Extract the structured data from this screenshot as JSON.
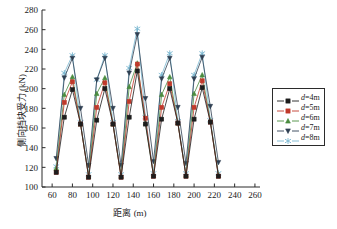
{
  "axes": {
    "xlabel": "距离 (m)",
    "ylabel": "侧向挡块受力 (kN)",
    "xticks": [
      60,
      80,
      100,
      120,
      140,
      160,
      180,
      200,
      220,
      240,
      260
    ],
    "yticks": [
      100,
      120,
      140,
      160,
      180,
      200,
      220,
      240,
      260,
      280
    ],
    "xlim": [
      50,
      265
    ],
    "ylim": [
      100,
      280
    ]
  },
  "legend": {
    "items": [
      {
        "label": "d=4m",
        "sym": "d",
        "rest": "=4m",
        "color": "#1d1d1d",
        "marker": "square"
      },
      {
        "label": "d=5m",
        "sym": "d",
        "rest": "=5m",
        "color": "#c0392b",
        "marker": "square"
      },
      {
        "label": "d=6m",
        "sym": "d",
        "rest": "=6m",
        "color": "#4a8c3f",
        "marker": "triangle-up"
      },
      {
        "label": "d=7m",
        "sym": "d",
        "rest": "=7m",
        "color": "#2f3f52",
        "marker": "triangle-down"
      },
      {
        "label": "d=8m",
        "sym": "d",
        "rest": "=8m",
        "color": "#79b7d0",
        "marker": "asterisk"
      }
    ]
  },
  "chart_data": {
    "type": "line",
    "title": "",
    "xlabel": "距离 (m)",
    "ylabel": "侧向挡块受力 (kN)",
    "xlim": [
      50,
      265
    ],
    "ylim": [
      100,
      280
    ],
    "grid": false,
    "legend_position": "right",
    "x": [
      64,
      72,
      80,
      88,
      96,
      104,
      112,
      120,
      128,
      136,
      144,
      152,
      160,
      168,
      176,
      184,
      192,
      200,
      208,
      216,
      224
    ],
    "series": [
      {
        "name": "d=4m",
        "color": "#1d1d1d",
        "marker": "square",
        "values": [
          115,
          171,
          199,
          164,
          110,
          168,
          200,
          164,
          110,
          171,
          218,
          164,
          111,
          169,
          200,
          165,
          111,
          169,
          201,
          166,
          111
        ]
      },
      {
        "name": "d=5m",
        "color": "#c0392b",
        "marker": "square",
        "values": [
          115,
          186,
          207,
          164,
          110,
          181,
          206,
          164,
          110,
          187,
          225,
          170,
          111,
          181,
          205,
          165,
          111,
          181,
          208,
          166,
          111
        ]
      },
      {
        "name": "d=6m",
        "color": "#4a8c3f",
        "marker": "triangle-up",
        "values": [
          119,
          194,
          212,
          164,
          111,
          195,
          211,
          164,
          111,
          202,
          226,
          165,
          112,
          194,
          212,
          165,
          112,
          195,
          214,
          167,
          112
        ]
      },
      {
        "name": "d=7m",
        "color": "#2f3f52",
        "marker": "triangle-down",
        "values": [
          129,
          211,
          231,
          180,
          122,
          209,
          231,
          180,
          122,
          216,
          255,
          190,
          126,
          210,
          231,
          181,
          124,
          210,
          232,
          182,
          125
        ]
      },
      {
        "name": "d=8m",
        "color": "#79b7d0",
        "marker": "asterisk",
        "values": [
          121,
          216,
          234,
          166,
          113,
          209,
          234,
          166,
          113,
          221,
          261,
          171,
          114,
          214,
          236,
          167,
          114,
          214,
          236,
          168,
          114
        ]
      }
    ]
  }
}
